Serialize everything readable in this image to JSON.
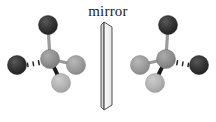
{
  "figure": {
    "background_color": "#ffffff",
    "width": 216,
    "height": 122
  },
  "mirror": {
    "label": "mirror",
    "label_x": 108,
    "label_y": 16,
    "face_fill": "#f7f7f7",
    "edge_fill": "#d8d8d8",
    "stroke": "#404040",
    "front_face": "104,22 112,27 112,105 104,110",
    "side_face": "101,25 104,22 104,110 101,107",
    "description": "thin three-dimensional reflective slab seen nearly edge-on"
  },
  "palette": {
    "dark": "#2f2f2f",
    "medium": "#8c8c8c",
    "medium_light": "#9a9a9a",
    "light": "#b3b3b3",
    "bond_plain": "#9a9a9a",
    "bond_wedge": "#1a1a1a",
    "bond_dash": "#262626",
    "atom_outline": "#6e6e6e"
  },
  "molecules": [
    {
      "name": "molecule-left",
      "side": "left",
      "center": {
        "id": "center",
        "cx": 50,
        "cy": 59,
        "r": 9.5,
        "color": "#8c8c8c",
        "label": "central-atom"
      },
      "atoms": [
        {
          "id": "top",
          "cx": 48,
          "cy": 25,
          "r": 9.5,
          "color": "#2f2f2f",
          "label": "top-atom-dark"
        },
        {
          "id": "left",
          "cx": 17,
          "cy": 65,
          "r": 9.5,
          "color": "#2f2f2f",
          "label": "left-atom-dark"
        },
        {
          "id": "right",
          "cx": 76,
          "cy": 65,
          "r": 9.5,
          "color": "#9a9a9a",
          "label": "right-atom-medium"
        },
        {
          "id": "bottom",
          "cx": 61,
          "cy": 83,
          "r": 9.5,
          "color": "#b3b3b3",
          "label": "bottom-atom-light"
        }
      ],
      "bonds": [
        {
          "id": "bond-top",
          "type": "plain",
          "from": "center",
          "to": "top"
        },
        {
          "id": "bond-left",
          "type": "hashed",
          "from": "center",
          "to": "left"
        },
        {
          "id": "bond-right",
          "type": "plain",
          "from": "center",
          "to": "right"
        },
        {
          "id": "bond-bottom",
          "type": "wedge",
          "from": "center",
          "to": "bottom"
        }
      ]
    },
    {
      "name": "molecule-right",
      "side": "right",
      "center": {
        "id": "center",
        "cx": 166,
        "cy": 59,
        "r": 9.5,
        "color": "#8c8c8c",
        "label": "central-atom"
      },
      "atoms": [
        {
          "id": "top",
          "cx": 168,
          "cy": 25,
          "r": 9.5,
          "color": "#2f2f2f",
          "label": "top-atom-dark"
        },
        {
          "id": "right",
          "cx": 199,
          "cy": 65,
          "r": 9.5,
          "color": "#2f2f2f",
          "label": "right-atom-dark"
        },
        {
          "id": "left",
          "cx": 140,
          "cy": 65,
          "r": 9.5,
          "color": "#9a9a9a",
          "label": "left-atom-medium"
        },
        {
          "id": "bottom",
          "cx": 155,
          "cy": 83,
          "r": 9.5,
          "color": "#b3b3b3",
          "label": "bottom-atom-light"
        }
      ],
      "bonds": [
        {
          "id": "bond-top",
          "type": "plain",
          "from": "center",
          "to": "top"
        },
        {
          "id": "bond-right",
          "type": "hashed",
          "from": "center",
          "to": "right"
        },
        {
          "id": "bond-left",
          "type": "plain",
          "from": "center",
          "to": "left"
        },
        {
          "id": "bond-bottom",
          "type": "wedge",
          "from": "center",
          "to": "bottom"
        }
      ]
    }
  ]
}
